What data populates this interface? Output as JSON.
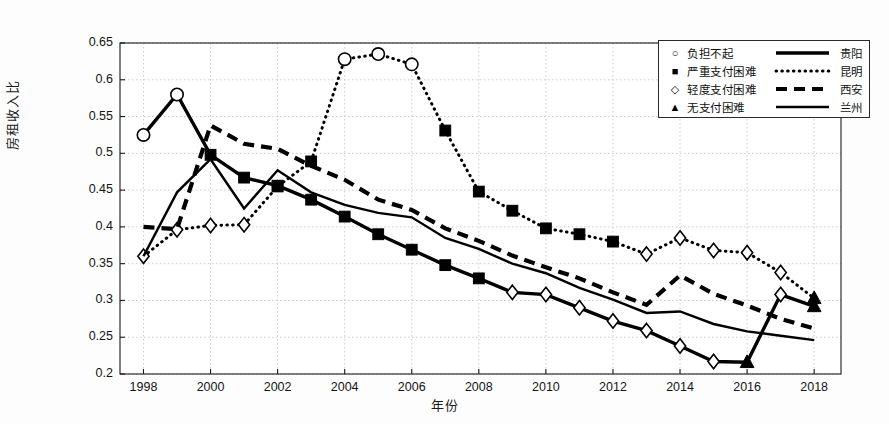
{
  "chart_data": {
    "type": "line",
    "title": "",
    "xlabel": "年份",
    "ylabel": "房租收入比",
    "xlim": [
      1997.3,
      2018.8
    ],
    "ylim": [
      0.2,
      0.65
    ],
    "grid": true,
    "legend_position": "top-right",
    "x": [
      1998,
      1999,
      2000,
      2001,
      2002,
      2003,
      2004,
      2005,
      2006,
      2007,
      2008,
      2009,
      2010,
      2011,
      2012,
      2013,
      2014,
      2015,
      2016,
      2017,
      2018
    ],
    "xticks": [
      1998,
      2000,
      2002,
      2004,
      2006,
      2008,
      2010,
      2012,
      2014,
      2016,
      2018
    ],
    "yticks": [
      0.2,
      0.25,
      0.3,
      0.35,
      0.4,
      0.45,
      0.5,
      0.55,
      0.6,
      0.65
    ],
    "ytick_labels": [
      "0.2",
      "0.25",
      "0.3",
      "0.35",
      "0.4",
      "0.45",
      "0.5",
      "0.55",
      "0.6",
      "0.65"
    ],
    "xtick_labels": [
      "1998",
      "2000",
      "2002",
      "2004",
      "2006",
      "2008",
      "2010",
      "2012",
      "2014",
      "2016",
      "2018"
    ],
    "series": [
      {
        "name": "贵阳",
        "line_style": "solid-thick",
        "values": [
          0.525,
          0.58,
          0.498,
          0.467,
          0.456,
          0.437,
          0.414,
          0.39,
          0.369,
          0.348,
          0.33,
          0.311,
          0.308,
          0.29,
          0.272,
          0.259,
          0.238,
          0.217,
          0.216,
          0.308,
          0.292
        ],
        "markers": [
          "circle",
          "circle",
          "square",
          "square",
          "square",
          "square",
          "square",
          "square",
          "square",
          "square",
          "square",
          "diamond",
          "diamond",
          "diamond",
          "diamond",
          "diamond",
          "diamond",
          "diamond",
          "triangle",
          "diamond",
          "triangle"
        ]
      },
      {
        "name": "昆明",
        "line_style": "dotted",
        "values": [
          0.36,
          0.396,
          0.402,
          0.403,
          0.455,
          0.489,
          0.628,
          0.635,
          0.621,
          0.531,
          0.448,
          0.422,
          0.398,
          0.39,
          0.38,
          0.363,
          0.385,
          0.368,
          0.365,
          0.338,
          0.303
        ],
        "markers": [
          "diamond",
          "diamond",
          "diamond",
          "diamond",
          "square",
          "square",
          "circle",
          "circle",
          "circle",
          "square",
          "square",
          "square",
          "square",
          "square",
          "square",
          "diamond",
          "diamond",
          "diamond",
          "diamond",
          "diamond",
          "triangle"
        ]
      },
      {
        "name": "西安",
        "line_style": "dashed",
        "values": [
          0.4,
          0.397,
          0.538,
          0.513,
          0.506,
          0.483,
          0.464,
          0.437,
          0.423,
          0.398,
          0.381,
          0.361,
          0.345,
          0.33,
          0.311,
          0.294,
          0.334,
          0.309,
          0.293,
          0.275,
          0.262
        ]
      },
      {
        "name": "兰州",
        "line_style": "solid",
        "values": [
          0.36,
          0.447,
          0.492,
          0.425,
          0.477,
          0.447,
          0.43,
          0.419,
          0.413,
          0.385,
          0.37,
          0.35,
          0.337,
          0.317,
          0.301,
          0.283,
          0.285,
          0.268,
          0.258,
          0.252,
          0.246
        ]
      }
    ],
    "legend_entries": [
      {
        "marker": "circle",
        "marker_label": "负担不起",
        "line_style": "solid-thick",
        "city": "贵阳"
      },
      {
        "marker": "square",
        "marker_label": "严重支付困难",
        "line_style": "dotted",
        "city": "昆明"
      },
      {
        "marker": "diamond",
        "marker_label": "轻度支付困难",
        "line_style": "dashed",
        "city": "西安"
      },
      {
        "marker": "triangle",
        "marker_label": "无支付困难",
        "line_style": "solid",
        "city": "兰州"
      }
    ],
    "colors": {
      "line": "#000000",
      "grid": "#bfbfbf",
      "axis": "#1a1a1a",
      "background": "#ffffff"
    }
  }
}
